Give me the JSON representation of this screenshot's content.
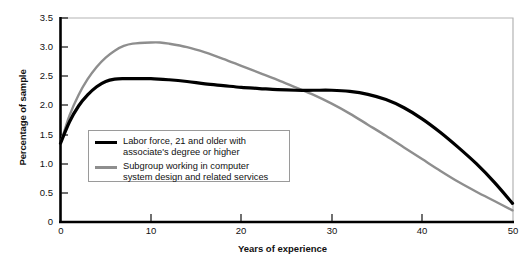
{
  "chart_data": {
    "type": "line",
    "title": "",
    "xlabel": "Years of experience",
    "ylabel": "Percentage of sample",
    "xlim": [
      0,
      50
    ],
    "ylim": [
      0,
      3.5
    ],
    "xticks": [
      "0",
      "10",
      "20",
      "30",
      "40",
      "50"
    ],
    "yticks": [
      "0",
      "0.5",
      "1.0",
      "1.5",
      "2.0",
      "2.5",
      "3.0",
      "3.5"
    ],
    "grid": false,
    "legend_position": "inside-lower-left",
    "series": [
      {
        "name": "Labor force, 21 and older with associate's degree or higher",
        "color": "#000000",
        "x": [
          0,
          1,
          2,
          3,
          4,
          5,
          6,
          7,
          8,
          10,
          12,
          14,
          16,
          18,
          20,
          22,
          24,
          26,
          28,
          30,
          32,
          34,
          36,
          38,
          40,
          42,
          44,
          46,
          48,
          50
        ],
        "y": [
          1.35,
          1.72,
          1.99,
          2.18,
          2.32,
          2.41,
          2.45,
          2.46,
          2.46,
          2.46,
          2.44,
          2.41,
          2.37,
          2.34,
          2.31,
          2.29,
          2.27,
          2.26,
          2.26,
          2.26,
          2.24,
          2.19,
          2.1,
          1.96,
          1.77,
          1.54,
          1.28,
          1.0,
          0.68,
          0.32
        ]
      },
      {
        "name": "Subgroup working in computer system design and related services",
        "color": "#8e8e8e",
        "x": [
          0,
          1,
          2,
          3,
          4,
          5,
          6,
          7,
          8,
          10,
          11,
          12,
          14,
          16,
          18,
          20,
          22,
          24,
          26,
          28,
          30,
          32,
          34,
          36,
          38,
          40,
          42,
          44,
          46,
          48,
          50
        ],
        "y": [
          1.35,
          1.83,
          2.18,
          2.45,
          2.66,
          2.82,
          2.94,
          3.02,
          3.06,
          3.08,
          3.08,
          3.06,
          3.0,
          2.91,
          2.8,
          2.68,
          2.56,
          2.44,
          2.31,
          2.18,
          2.03,
          1.86,
          1.67,
          1.48,
          1.28,
          1.08,
          0.88,
          0.69,
          0.52,
          0.36,
          0.2
        ]
      }
    ]
  },
  "legend": {
    "items": [
      {
        "line1": "Labor force, 21 and older with",
        "line2": "associate's degree or higher",
        "swatch": "black-line-swatch"
      },
      {
        "line1": "Subgroup working in computer",
        "line2": "system design and related services",
        "swatch": "gray-line-swatch"
      }
    ]
  },
  "caption": {
    "text": "                            "
  }
}
